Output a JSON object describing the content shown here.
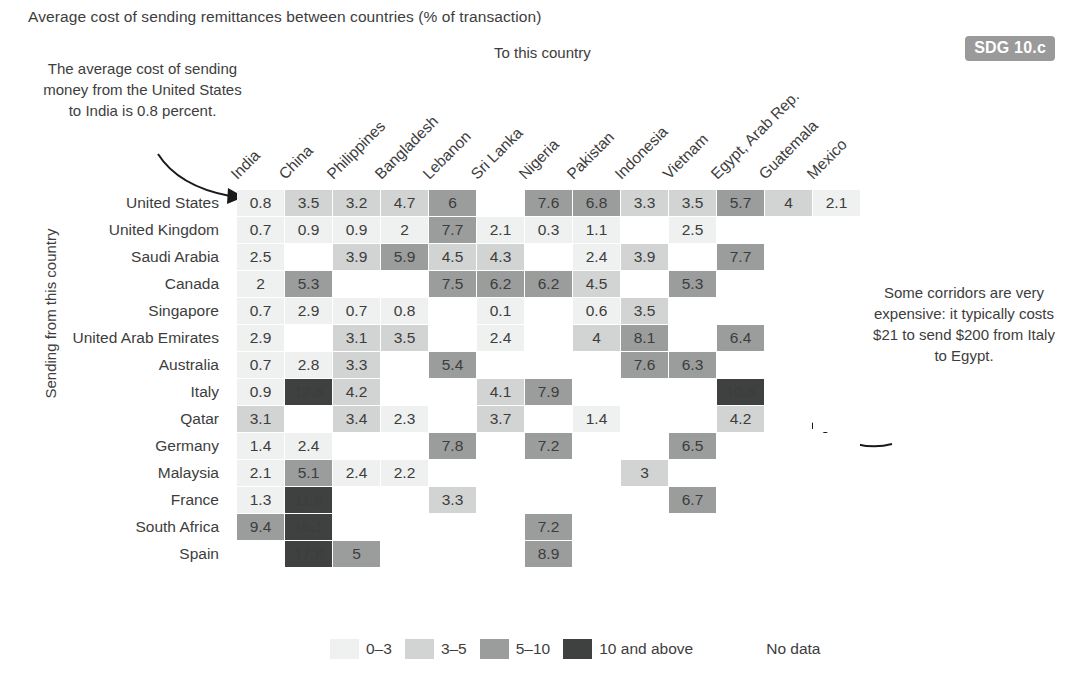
{
  "title": "Average cost of sending remittances between countries (% of transaction)",
  "badge": "SDG 10.c",
  "axis": {
    "top": "To this country",
    "left": "Sending from this country"
  },
  "annotations": {
    "left": "The average cost of sending money from the United States to India is 0.8 percent.",
    "right": "Some corridors are very expensive: it typically costs $21 to send $200 from Italy to Egypt."
  },
  "legend": {
    "items": [
      {
        "label": "0–3",
        "color": "#eff0f0"
      },
      {
        "label": "3–5",
        "color": "#d2d3d3"
      },
      {
        "label": "5–10",
        "color": "#9b9c9c"
      },
      {
        "label": "10 and above",
        "color": "#3f4040"
      }
    ],
    "nodata": {
      "label": "No data",
      "color": "#ffffff"
    }
  },
  "chart_data": {
    "type": "heatmap",
    "title": "Average cost of sending remittances between countries (% of transaction)",
    "xlabel": "To this country",
    "ylabel": "Sending from this country",
    "columns": [
      "India",
      "China",
      "Philippines",
      "Bangladesh",
      "Lebanon",
      "Sri Lanka",
      "Nigeria",
      "Pakistan",
      "Indonesia",
      "Vietnam",
      "Egypt, Arab Rep.",
      "Guatemala",
      "Mexico"
    ],
    "rows": [
      "United States",
      "United Kingdom",
      "Saudi Arabia",
      "Canada",
      "Singapore",
      "United Arab Emirates",
      "Australia",
      "Italy",
      "Qatar",
      "Germany",
      "Malaysia",
      "France",
      "South Africa",
      "Spain"
    ],
    "bins": [
      {
        "name": "0–3",
        "min": 0,
        "max": 3,
        "color": "#eff0f0"
      },
      {
        "name": "3–5",
        "min": 3,
        "max": 5,
        "color": "#d2d3d3"
      },
      {
        "name": "5–10",
        "min": 5,
        "max": 10,
        "color": "#9b9c9c"
      },
      {
        "name": "10 and above",
        "min": 10,
        "max": null,
        "color": "#3f4040"
      },
      {
        "name": "No data",
        "min": null,
        "max": null,
        "color": "#ffffff"
      }
    ],
    "values": [
      [
        0.8,
        3.5,
        3.2,
        4.7,
        6,
        null,
        7.6,
        6.8,
        3.3,
        3.5,
        5.7,
        4,
        2.1
      ],
      [
        0.7,
        0.9,
        0.9,
        2,
        7.7,
        2.1,
        0.3,
        1.1,
        null,
        2.5,
        null,
        null,
        null
      ],
      [
        2.5,
        null,
        3.9,
        5.9,
        4.5,
        4.3,
        null,
        2.4,
        3.9,
        null,
        7.7,
        null,
        null
      ],
      [
        2,
        5.3,
        null,
        null,
        7.5,
        6.2,
        6.2,
        4.5,
        null,
        5.3,
        null,
        null,
        null
      ],
      [
        0.7,
        2.9,
        0.7,
        0.8,
        null,
        0.1,
        null,
        0.6,
        3.5,
        null,
        null,
        null,
        null
      ],
      [
        2.9,
        null,
        3.1,
        3.5,
        null,
        2.4,
        null,
        4,
        8.1,
        null,
        6.4,
        null,
        null
      ],
      [
        0.7,
        2.8,
        3.3,
        null,
        5.4,
        null,
        null,
        null,
        7.6,
        6.3,
        null,
        null,
        null
      ],
      [
        0.9,
        12.6,
        4.2,
        null,
        null,
        4.1,
        7.9,
        null,
        null,
        null,
        10.6,
        null,
        null
      ],
      [
        3.1,
        null,
        3.4,
        2.3,
        null,
        3.7,
        null,
        1.4,
        null,
        null,
        4.2,
        null,
        null
      ],
      [
        1.4,
        2.4,
        null,
        null,
        7.8,
        null,
        7.2,
        null,
        null,
        6.5,
        null,
        null,
        null
      ],
      [
        2.1,
        5.1,
        2.4,
        2.2,
        null,
        null,
        null,
        null,
        3,
        null,
        null,
        null,
        null
      ],
      [
        1.3,
        11.8,
        null,
        null,
        3.3,
        null,
        null,
        null,
        null,
        6.7,
        null,
        null,
        null
      ],
      [
        9.4,
        16.1,
        null,
        null,
        null,
        null,
        7.2,
        null,
        null,
        null,
        null,
        null,
        null
      ],
      [
        null,
        17.8,
        5,
        null,
        null,
        null,
        8.9,
        null,
        null,
        null,
        null,
        null,
        null
      ]
    ]
  }
}
